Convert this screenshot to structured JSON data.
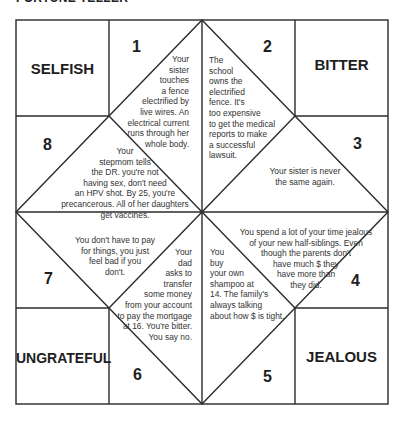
{
  "title": "FORTUNE TELLER",
  "colors": {
    "line": "#2a2a2a",
    "text": "#222222",
    "background": "#ffffff"
  },
  "corners": {
    "top_left": "SELFISH",
    "top_right": "BITTER",
    "bottom_left": "UNGRATEFUL",
    "bottom_right": "JEALOUS"
  },
  "flaps": [
    {
      "number": "1",
      "fortune": "Your\nsister\ntouches\na fence\nelectrified by\nlive wires. An\nelectrical current\nruns through her\nwhole body."
    },
    {
      "number": "2",
      "fortune": "The\nschool\nowns the\nelectrified\nfence. It's\ntoo expensive\nto get the medical\nreports to make\na successful\nlawsuit."
    },
    {
      "number": "3",
      "fortune": "Your sister is never\nthe same again."
    },
    {
      "number": "4",
      "fortune": "You spend a lot of your time jealous\nof your new half-siblings. Even\nthough the parents don't\nhave much $ they\nhave more than\nthey did."
    },
    {
      "number": "5",
      "fortune": "You\nbuy\nyour own\nshampoo at\n14. The family's\nalways talking\nabout how $ is tight."
    },
    {
      "number": "6",
      "fortune": "Your\ndad\nasks to\ntransfer\nsome money\nfrom your account\nto pay the mortgage\nat 16. You're bitter.\nYou say no."
    },
    {
      "number": "7",
      "fortune": "You don't have to pay\nfor things, you just\nfeel bad if you\ndon't."
    },
    {
      "number": "8",
      "fortune": "Your\nstepmom tells\nthe DR. you're not\nhaving sex, don't need\nan HPV shot. By 25, you're\nprecancerous. All of her daughters\nget vaccines."
    }
  ]
}
